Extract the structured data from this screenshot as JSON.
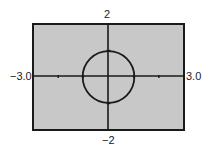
{
  "chart_data": {
    "type": "line",
    "title": "",
    "equation": "x^2 + y^2 = 1",
    "xlabel": "",
    "ylabel": "",
    "xlim": [
      -3.0,
      3.0
    ],
    "ylim": [
      -2,
      2
    ],
    "xscale": 1,
    "yscale": 1,
    "grid": false,
    "series": [
      {
        "name": "circle",
        "center": [
          0,
          0
        ],
        "radius": 1
      }
    ]
  },
  "window": {
    "xmin_label": "−3.0",
    "xmax_label": "3.0",
    "ymax_label": "2",
    "ymin_label": "−2"
  },
  "colors": {
    "screen_bg": "#c8c8c8",
    "frame": "#1a1a1a",
    "curve": "#1a1a1a"
  }
}
